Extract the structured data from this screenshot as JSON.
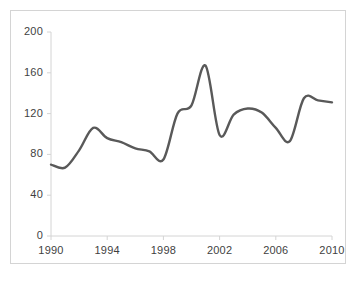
{
  "chart_data": {
    "type": "line",
    "title": "",
    "subtitle": "",
    "xlabel": "",
    "ylabel": "",
    "xlim": [
      1990,
      2010
    ],
    "ylim": [
      0,
      200
    ],
    "ytick_labels": [
      "0",
      "40",
      "80",
      "120",
      "160",
      "200"
    ],
    "yticks": [
      0,
      40,
      80,
      120,
      160,
      200
    ],
    "xtick_labels": [
      "1990",
      "1994",
      "1998",
      "2002",
      "2006",
      "2010"
    ],
    "xticks": [
      1990,
      1994,
      1998,
      2002,
      2006,
      2010
    ],
    "grid": false,
    "legend": "none",
    "line_color": "#595959",
    "line_width": 2.4,
    "axis_color": "#d4d4d4",
    "background": "#ffffff",
    "x": [
      1990,
      1991,
      1992,
      1993,
      1994,
      1995,
      1996,
      1997,
      1998,
      1999,
      2000,
      2001,
      2002,
      2003,
      2004,
      2005,
      2006,
      2007,
      2008,
      2009,
      2010
    ],
    "values": [
      70,
      67,
      84,
      106,
      96,
      92,
      86,
      83,
      75,
      120,
      128,
      167,
      99,
      119,
      125,
      121,
      106,
      93,
      135,
      133,
      131
    ],
    "series": [
      {
        "name": "series-1",
        "values": [
          70,
          67,
          84,
          106,
          96,
          92,
          86,
          83,
          75,
          120,
          128,
          167,
          99,
          119,
          125,
          121,
          106,
          93,
          135,
          133,
          131
        ]
      }
    ]
  },
  "axes": {
    "y_labels": [
      "200",
      "160",
      "120",
      "80",
      "40",
      "0"
    ],
    "x_labels": [
      "1990",
      "1994",
      "1998",
      "2002",
      "2006",
      "2010"
    ]
  }
}
